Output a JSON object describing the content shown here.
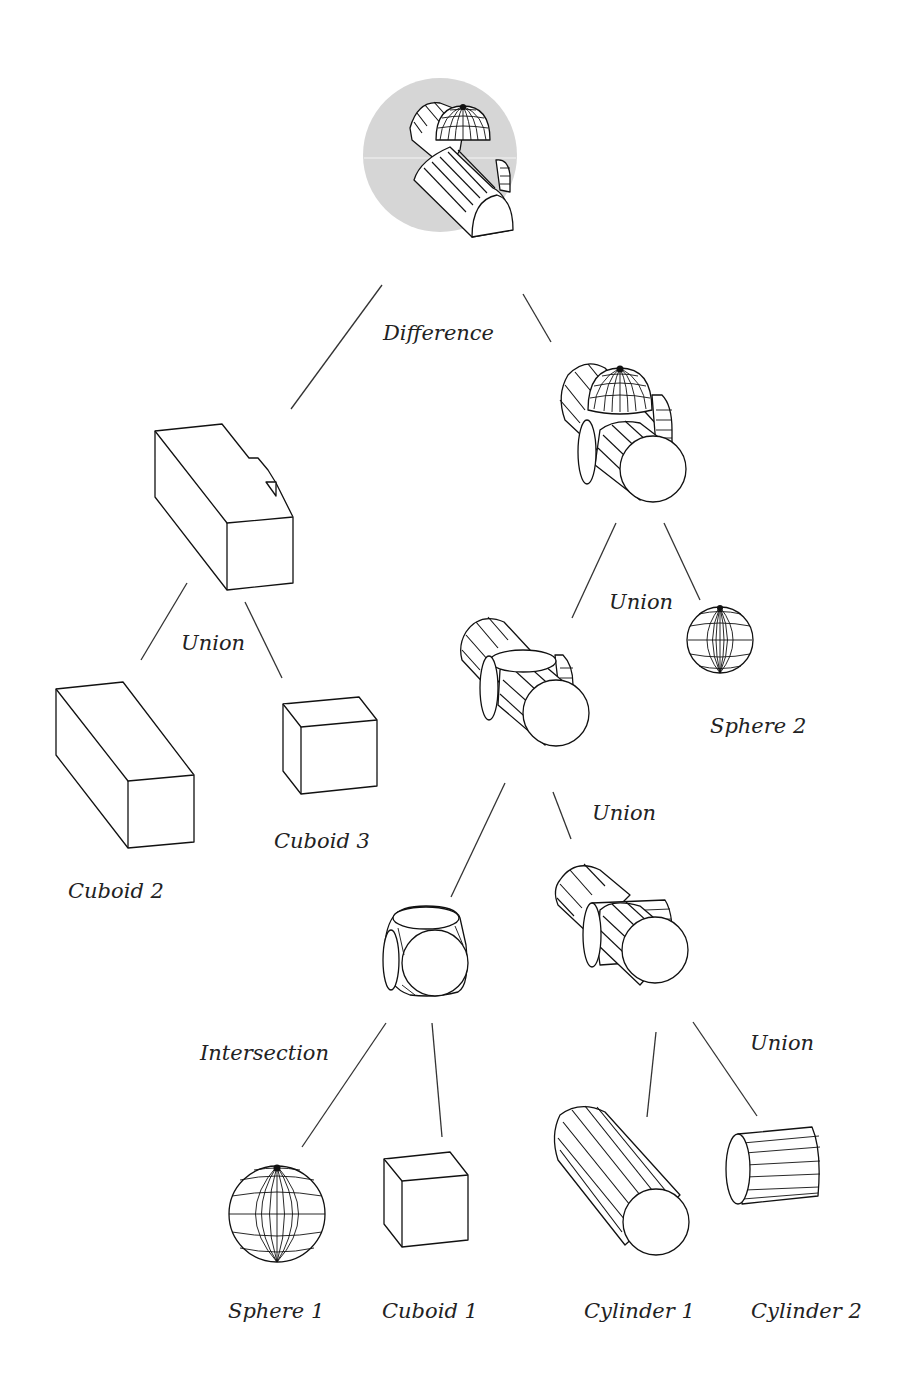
{
  "diagram": {
    "type": "csg-tree",
    "root": "Difference",
    "highlight_color": "#d6d6d6",
    "nodes": {
      "difference": {
        "label": "Difference",
        "operation": "difference",
        "highlighted": true
      },
      "union_left": {
        "label": "Union",
        "operation": "union"
      },
      "union_right_top": {
        "label": "Union",
        "operation": "union"
      },
      "union_mid": {
        "label": "Union",
        "operation": "union"
      },
      "intersection": {
        "label": "Intersection",
        "operation": "intersection"
      },
      "union_cyl": {
        "label": "Union",
        "operation": "union"
      },
      "cuboid2": {
        "label": "Cuboid 2",
        "primitive": "cuboid"
      },
      "cuboid3": {
        "label": "Cuboid 3",
        "primitive": "cuboid"
      },
      "sphere2": {
        "label": "Sphere 2",
        "primitive": "sphere"
      },
      "sphere1": {
        "label": "Sphere 1",
        "primitive": "sphere"
      },
      "cuboid1": {
        "label": "Cuboid 1",
        "primitive": "cuboid"
      },
      "cylinder1": {
        "label": "Cylinder 1",
        "primitive": "cylinder"
      },
      "cylinder2": {
        "label": "Cylinder 2",
        "primitive": "cylinder"
      }
    },
    "edges": [
      [
        "difference",
        "union_left"
      ],
      [
        "difference",
        "union_right_top"
      ],
      [
        "union_left",
        "cuboid2"
      ],
      [
        "union_left",
        "cuboid3"
      ],
      [
        "union_right_top",
        "union_mid"
      ],
      [
        "union_right_top",
        "sphere2"
      ],
      [
        "union_mid",
        "intersection"
      ],
      [
        "union_mid",
        "union_cyl"
      ],
      [
        "intersection",
        "sphere1"
      ],
      [
        "intersection",
        "cuboid1"
      ],
      [
        "union_cyl",
        "cylinder1"
      ],
      [
        "union_cyl",
        "cylinder2"
      ]
    ]
  }
}
